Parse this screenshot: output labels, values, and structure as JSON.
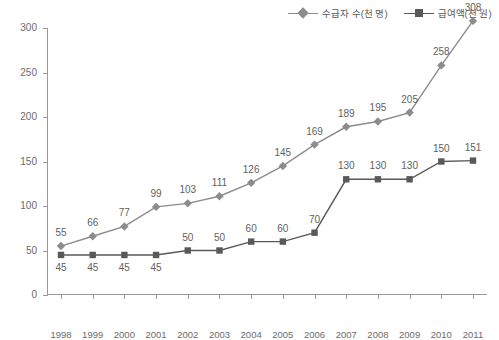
{
  "legend": {
    "position": "top-right",
    "entries": [
      {
        "label": "수급자 수(천 명)",
        "marker": "diamond-marker-icon",
        "color": "#8c8c8c"
      },
      {
        "label": "급여액(천 원)",
        "marker": "square-marker-icon",
        "color": "#595959"
      }
    ]
  },
  "chart_data": {
    "type": "line",
    "title": "",
    "subtitle": "",
    "xlabel": "",
    "ylabel": "",
    "grid": false,
    "legend_position": "top-right",
    "ylim": [
      0,
      300
    ],
    "yticks": [
      0,
      50,
      100,
      150,
      200,
      250,
      300
    ],
    "categories": [
      "1998",
      "1999",
      "2000",
      "2001",
      "2002",
      "2003",
      "2004",
      "2005",
      "2006",
      "2007",
      "2008",
      "2009",
      "2010",
      "2011"
    ],
    "series": [
      {
        "name": "수급자 수(천 명)",
        "color": "#8c8c8c",
        "marker": "diamond",
        "label_position": "above",
        "values": [
          55,
          66,
          77,
          99,
          103,
          111,
          126,
          145,
          169,
          189,
          195,
          205,
          258,
          308
        ]
      },
      {
        "name": "급여액(천 원)",
        "color": "#595959",
        "marker": "square",
        "label_position": "mixed",
        "values": [
          45,
          45,
          45,
          45,
          50,
          50,
          60,
          60,
          70,
          130,
          130,
          130,
          150,
          151
        ],
        "label_offsets": [
          "below",
          "below",
          "below",
          "below",
          "above",
          "above",
          "above",
          "above",
          "above",
          "above",
          "above",
          "above",
          "above",
          "above"
        ]
      }
    ]
  },
  "colors": {
    "series1": "#8c8c8c",
    "series2": "#595959",
    "axis": "#9a9a9a",
    "text": "#6b6b6b",
    "background": "#ffffff"
  }
}
